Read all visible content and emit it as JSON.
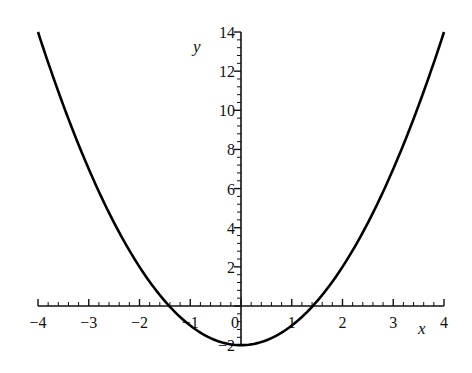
{
  "chart_data": {
    "type": "line",
    "title": "",
    "xlabel": "x",
    "ylabel": "y",
    "function": "y = x^2 - 2",
    "xlim": [
      -4,
      4
    ],
    "ylim": [
      -2,
      14
    ],
    "grid": false,
    "legend": null,
    "x_ticks": [
      -4,
      -3,
      -2,
      -1,
      0,
      1,
      2,
      3,
      4
    ],
    "x_tick_labels": [
      "−4",
      "−3",
      "−2",
      "−1",
      "0",
      "1",
      "2",
      "3",
      "4"
    ],
    "y_ticks": [
      -2,
      2,
      4,
      6,
      8,
      10,
      12,
      14
    ],
    "y_tick_labels": [
      "−2",
      "2",
      "4",
      "6",
      "8",
      "10",
      "12",
      "14"
    ],
    "minor_tick_step": {
      "x": 0.2,
      "y": 0.4
    },
    "series": [
      {
        "name": "x^2 - 2",
        "color": "#000000",
        "x": [
          -4,
          -3.5,
          -3,
          -2.5,
          -2,
          -1.5,
          -1.414,
          -1,
          -0.5,
          0,
          0.5,
          1,
          1.414,
          1.5,
          2,
          2.5,
          3,
          3.5,
          4
        ],
        "y": [
          14,
          10.25,
          7,
          4.25,
          2,
          0.25,
          0,
          -1,
          -1.75,
          -2,
          -1.75,
          -1,
          0,
          0.25,
          2,
          4.25,
          7,
          10.25,
          14
        ]
      }
    ],
    "annotations": []
  },
  "layout": {
    "origin_px": [
      241,
      306
    ],
    "x_px_per_unit": 50.75,
    "y_px_per_unit": 19.57,
    "curve_color": "#000000",
    "axis_color": "#111111"
  }
}
